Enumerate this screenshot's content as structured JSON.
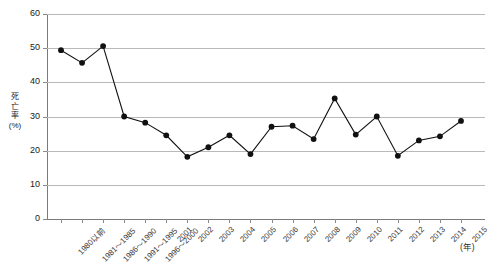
{
  "chart_data": {
    "type": "line",
    "title": "",
    "xlabel": "(年)",
    "ylabel": "死亡率(%)",
    "ylim": [
      0,
      60
    ],
    "ytick_step": 10,
    "yticks": [
      "60",
      "50",
      "40",
      "30",
      "20",
      "10",
      "0"
    ],
    "grid": true,
    "legend": "none",
    "marker": "filled-circle",
    "line_color": "#111111",
    "marker_color": "#111111",
    "grid_color": "#b9b9b9",
    "categories": [
      "1980以前",
      "1981～1985",
      "1986～1990",
      "1991～1995",
      "1996～2000",
      "2001",
      "2002",
      "2003",
      "2004",
      "2005",
      "2006",
      "2007",
      "2008",
      "2009",
      "2010",
      "2011",
      "2012",
      "2013",
      "2014",
      "2015"
    ],
    "values": [
      49.4,
      45.7,
      50.6,
      30.0,
      28.2,
      24.5,
      18.2,
      21.0,
      24.5,
      19.0,
      27.0,
      27.3,
      23.4,
      35.3,
      24.7,
      30.0,
      18.5,
      23.0,
      24.2,
      28.7
    ],
    "ylabel_chars": [
      "死",
      "亡",
      "率",
      "(%)"
    ]
  },
  "axis": {
    "y_unit_note": "%",
    "x_unit_note": "年"
  }
}
